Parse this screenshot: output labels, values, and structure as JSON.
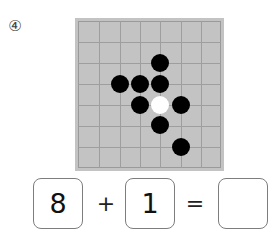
{
  "question": {
    "number_label": "④"
  },
  "board": {
    "colors": {
      "background": "#c3c3c3",
      "line": "#9e9e9e",
      "black": "#000000",
      "white": "#ffffff"
    },
    "cells": 7,
    "stones": [
      {
        "color": "black",
        "x": 160,
        "y": 63
      },
      {
        "color": "black",
        "x": 120,
        "y": 84
      },
      {
        "color": "black",
        "x": 140,
        "y": 84
      },
      {
        "color": "black",
        "x": 160,
        "y": 84
      },
      {
        "color": "black",
        "x": 140,
        "y": 105
      },
      {
        "color": "white",
        "x": 160,
        "y": 105
      },
      {
        "color": "black",
        "x": 181,
        "y": 105
      },
      {
        "color": "black",
        "x": 160,
        "y": 125
      },
      {
        "color": "black",
        "x": 181,
        "y": 147
      }
    ]
  },
  "equation": {
    "operand1": "8",
    "plus": "+",
    "operand2": "1",
    "equals": "=",
    "answer": ""
  }
}
